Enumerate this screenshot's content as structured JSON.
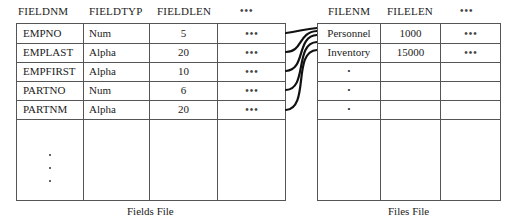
{
  "fields_file": {
    "caption": "Fields File",
    "headers": [
      "FIELDNM",
      "FIELDTYP",
      "FIELDLEN",
      "•••"
    ],
    "rows": [
      {
        "name": "EMPNO",
        "type": "Num",
        "len": "5",
        "more": "•••"
      },
      {
        "name": "EMPLAST",
        "type": "Alpha",
        "len": "20",
        "more": "•••"
      },
      {
        "name": "EMPFIRST",
        "type": "Alpha",
        "len": "10",
        "more": "•••"
      },
      {
        "name": "PARTNO",
        "type": "Num",
        "len": "6",
        "more": "•••"
      },
      {
        "name": "PARTNM",
        "type": "Alpha",
        "len": "20",
        "more": "•••"
      }
    ],
    "continuation": "vertical-ellipsis"
  },
  "files_file": {
    "caption": "Files File",
    "headers": [
      "FILENM",
      "FILELEN",
      "•••"
    ],
    "rows": [
      {
        "name": "Personnel",
        "len": "1000",
        "more": "•••"
      },
      {
        "name": "Inventory",
        "len": "15000",
        "more": "•••"
      },
      {
        "name": "•",
        "len": "",
        "more": ""
      },
      {
        "name": "•",
        "len": "",
        "more": ""
      },
      {
        "name": "•",
        "len": "",
        "more": ""
      }
    ]
  },
  "links": [
    {
      "from_row": 0,
      "to": "files_file"
    },
    {
      "from_row": 1,
      "to": "files_file"
    },
    {
      "from_row": 2,
      "to": "files_file"
    },
    {
      "from_row": 3,
      "to": "files_file"
    },
    {
      "from_row": 4,
      "to": "files_file"
    }
  ]
}
